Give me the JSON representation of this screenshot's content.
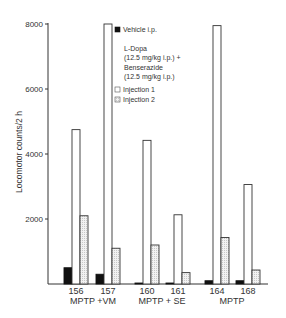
{
  "chart_data": {
    "type": "bar",
    "title": "",
    "xlabel": "",
    "ylabel": "Locomotor counts/2 h",
    "ylim": [
      0,
      8000
    ],
    "yticks": [
      2000,
      4000,
      6000,
      8000
    ],
    "ytick_labels": [
      "2000",
      "4000",
      "6000",
      "8000"
    ],
    "grid": false,
    "legend_position": "top-center",
    "categories": [
      "156",
      "157",
      "160",
      "161",
      "164",
      "168"
    ],
    "groups": [
      {
        "label": "MPTP +VM",
        "categories": [
          "156",
          "157"
        ]
      },
      {
        "label": "MPTP + SE",
        "categories": [
          "160",
          "161"
        ]
      },
      {
        "label": "MPTP",
        "categories": [
          "164",
          "168"
        ]
      }
    ],
    "series": [
      {
        "name": "Vehicle i.p.",
        "style": "solid-black",
        "values": [
          500,
          300,
          30,
          30,
          100,
          100
        ]
      },
      {
        "name": "Injection 1",
        "style": "open-white",
        "values": [
          4750,
          8000,
          4420,
          2130,
          7950,
          3060
        ]
      },
      {
        "name": "Injection 2",
        "style": "stippled-light",
        "values": [
          2100,
          1100,
          1200,
          350,
          1430,
          430
        ]
      }
    ],
    "legend": {
      "vehicle": "Vehicle i.p.",
      "treatment_lines": [
        "L-Dopa",
        "(12.5 mg/kg i.p.) +",
        "Benserazide",
        "(12.5 mg/kg i.p.)"
      ],
      "injection1": "Injection 1",
      "injection2": "Injection 2"
    },
    "colors": {
      "vehicle": "#111111",
      "injection1": "#ffffff",
      "injection2": "#ececec",
      "outline": "#333333"
    }
  }
}
